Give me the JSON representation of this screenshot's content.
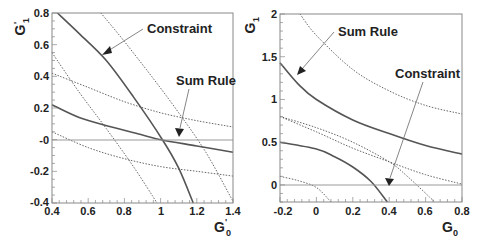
{
  "chart_data": [
    {
      "type": "line",
      "panel": "left",
      "xlabel": "G'0",
      "ylabel": "G'1",
      "xlim": [
        0.4,
        1.4
      ],
      "ylim": [
        -0.4,
        0.8
      ],
      "xticks": [
        "0.4",
        "0.6",
        "0.8",
        "1",
        "1.2",
        "1.4"
      ],
      "yticks": [
        "0.8",
        "0.6",
        "0.4",
        "0.2",
        "-0",
        "-0.2",
        "-0.4"
      ],
      "grid": false,
      "reference_line": {
        "y": 0
      },
      "annotations": [
        {
          "text": "Constraint",
          "arrow_to": [
            0.7,
            0.55
          ]
        },
        {
          "text": "Sum Rule",
          "arrow_to": [
            1.1,
            0.05
          ]
        }
      ],
      "series": [
        {
          "name": "Constraint",
          "style": "solid",
          "x": [
            0.43,
            0.55,
            0.7,
            0.85,
            1.01,
            1.1,
            1.18
          ],
          "y": [
            0.8,
            0.67,
            0.5,
            0.27,
            0.0,
            -0.18,
            -0.4
          ]
        },
        {
          "name": "Constraint upper bound",
          "style": "dotted",
          "x": [
            0.67,
            0.8,
            0.95,
            1.1,
            1.25,
            1.4
          ],
          "y": [
            0.8,
            0.62,
            0.4,
            0.17,
            -0.08,
            -0.39
          ]
        },
        {
          "name": "Constraint lower bound",
          "style": "dotted",
          "x": [
            0.4,
            0.55,
            0.7,
            0.85,
            0.98
          ],
          "y": [
            0.55,
            0.3,
            0.07,
            -0.17,
            -0.4
          ]
        },
        {
          "name": "Sum Rule",
          "style": "solid",
          "x": [
            0.4,
            0.55,
            0.73,
            0.9,
            1.0,
            1.2,
            1.4
          ],
          "y": [
            0.22,
            0.14,
            0.08,
            0.03,
            0.0,
            -0.04,
            -0.08
          ]
        },
        {
          "name": "Sum Rule upper bound",
          "style": "dotted",
          "x": [
            0.4,
            0.6,
            0.8,
            1.0,
            1.2,
            1.4
          ],
          "y": [
            0.42,
            0.33,
            0.24,
            0.17,
            0.12,
            0.08
          ]
        },
        {
          "name": "Sum Rule lower bound",
          "style": "dotted",
          "x": [
            0.4,
            0.6,
            0.8,
            1.0,
            1.2,
            1.4
          ],
          "y": [
            0.05,
            -0.05,
            -0.12,
            -0.17,
            -0.2,
            -0.23
          ]
        }
      ]
    },
    {
      "type": "line",
      "panel": "right",
      "xlabel": "G0",
      "ylabel": "G1",
      "xlim": [
        -0.2,
        0.8
      ],
      "ylim": [
        -0.2,
        2.0
      ],
      "xticks": [
        "-0.2",
        "0",
        "0.2",
        "0.4",
        "0.6",
        "0.8"
      ],
      "yticks": [
        "2",
        "1.5",
        "1",
        "0.5",
        "0"
      ],
      "grid": false,
      "reference_line": {
        "y": 0
      },
      "annotations": [
        {
          "text": "Sum Rule",
          "arrow_to": [
            -0.1,
            1.3
          ]
        },
        {
          "text": "Constraint",
          "arrow_to": [
            0.39,
            0.0
          ]
        }
      ],
      "series": [
        {
          "name": "Sum Rule",
          "style": "solid",
          "x": [
            -0.2,
            -0.1,
            0.0,
            0.2,
            0.4,
            0.6,
            0.8
          ],
          "y": [
            1.43,
            1.18,
            1.0,
            0.76,
            0.6,
            0.46,
            0.36
          ]
        },
        {
          "name": "Sum Rule upper bound",
          "style": "dotted",
          "x": [
            -0.09,
            0.0,
            0.2,
            0.4,
            0.6,
            0.8
          ],
          "y": [
            2.0,
            1.75,
            1.35,
            1.1,
            0.93,
            0.83
          ]
        },
        {
          "name": "Sum Rule lower bound",
          "style": "dotted",
          "x": [
            -0.2,
            0.0,
            0.2,
            0.4,
            0.6,
            0.8
          ],
          "y": [
            0.8,
            0.62,
            0.43,
            0.27,
            0.12,
            0.01
          ]
        },
        {
          "name": "Constraint",
          "style": "solid",
          "x": [
            -0.2,
            0.0,
            0.1,
            0.2,
            0.3,
            0.39
          ],
          "y": [
            0.5,
            0.42,
            0.33,
            0.21,
            0.04,
            -0.2
          ]
        },
        {
          "name": "Constraint upper bound",
          "style": "dotted",
          "x": [
            -0.2,
            0.0,
            0.2,
            0.4,
            0.5,
            0.65
          ],
          "y": [
            0.8,
            0.67,
            0.5,
            0.27,
            0.1,
            -0.2
          ]
        },
        {
          "name": "Constraint lower bound",
          "style": "dotted",
          "x": [
            -0.2,
            -0.1,
            0.0,
            0.08
          ],
          "y": [
            0.1,
            0.05,
            -0.03,
            -0.2
          ]
        }
      ]
    }
  ],
  "left": {
    "ylabel_main": "G",
    "ylabel_sup": "'",
    "ylabel_sub": "1",
    "xlabel_main": "G",
    "xlabel_sup": "'",
    "xlabel_sub": "0",
    "xticks": [
      "0.4",
      "0.6",
      "0.8",
      "1",
      "1.2",
      "1.4"
    ],
    "yticks": [
      "0.8",
      "0.6",
      "0.4",
      "0.2",
      "-0",
      "-0.2",
      "-0.4"
    ],
    "annot_constraint": "Constraint",
    "annot_sumrule": "Sum Rule"
  },
  "right": {
    "ylabel_main": "G",
    "ylabel_sub": "1",
    "xlabel_main": "G",
    "xlabel_sub": "0",
    "xticks": [
      "-0.2",
      "0",
      "0.2",
      "0.4",
      "0.6",
      "0.8"
    ],
    "yticks": [
      "2",
      "1.5",
      "1",
      "0.5",
      "0"
    ],
    "annot_sumrule": "Sum Rule",
    "annot_constraint": "Constraint"
  },
  "colors": {
    "solid": "#555555",
    "dotted": "#555555",
    "frame": "#888888",
    "zero_line": "#999999",
    "arrow": "#666666"
  }
}
